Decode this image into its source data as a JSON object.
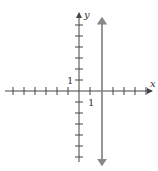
{
  "diagram": {
    "type": "coordinate-plane",
    "axes": {
      "x_label": "x",
      "y_label": "y",
      "x_range": [
        -6,
        6
      ],
      "y_range": [
        -6,
        6
      ],
      "tick_spacing": 1,
      "unit_label_x": "1",
      "unit_label_y": "1"
    },
    "lines": [
      {
        "kind": "vertical",
        "x": 2,
        "equation": "x = 2",
        "color": "#888888"
      }
    ],
    "colors": {
      "axis": "#444444",
      "line": "#888888"
    }
  }
}
